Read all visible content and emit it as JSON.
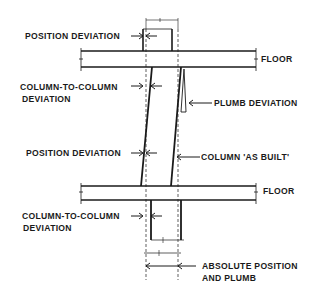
{
  "diagram": {
    "colors": {
      "line": "#1a1a1a",
      "background": "#ffffff"
    },
    "labels": {
      "position_deviation_top": "POSITION DEVIATION",
      "floor_top": "FLOOR",
      "col_to_col_top_line1": "COLUMN-TO-COLUMN",
      "col_to_col_top_line2": "DEVIATION",
      "plumb_deviation": "PLUMB DEVIATION",
      "position_deviation_mid": "POSITION DEVIATION",
      "column_as_built": "COLUMN 'AS BUILT'",
      "floor_bottom": "FLOOR",
      "col_to_col_bottom_line1": "COLUMN-TO-COLUMN",
      "col_to_col_bottom_line2": "DEVIATION",
      "absolute_line1": "ABSOLUTE POSITION",
      "absolute_line2": "AND PLUMB"
    }
  }
}
